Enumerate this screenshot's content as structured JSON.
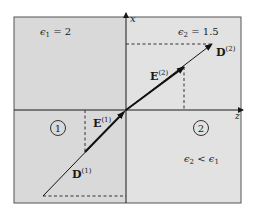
{
  "diagram": {
    "type": "dielectric-boundary-refraction",
    "colors": {
      "background": "#ffffff",
      "region_fill": "#dcdcdc",
      "frame": "#555555",
      "axis": "#1a1a1a",
      "vector": "#111111",
      "dashed": "#333333"
    },
    "axes": {
      "vertical_label": "x",
      "horizontal_label": "z"
    },
    "regions": [
      {
        "id": "1",
        "marker": "1",
        "permittivity_label": "ϵ₁ = 2"
      },
      {
        "id": "2",
        "marker": "2",
        "permittivity_label": "ϵ₂ = 1.5",
        "relation_label": "ϵ₂ < ϵ₁"
      }
    ],
    "vectors": [
      {
        "name": "D(1)",
        "symbol": "D",
        "superscript": "(1)",
        "region": "1"
      },
      {
        "name": "E(1)",
        "symbol": "E",
        "superscript": "(1)",
        "region": "1"
      },
      {
        "name": "E(2)",
        "symbol": "E",
        "superscript": "(2)",
        "region": "2"
      },
      {
        "name": "D(2)",
        "symbol": "D",
        "superscript": "(2)",
        "region": "2"
      }
    ]
  },
  "labels": {
    "eps1_symbol": "ϵ",
    "eps1_sub": "1",
    "eps1_value": " = 2",
    "eps2_symbol": "ϵ",
    "eps2_sub": "2",
    "eps2_value": " = 1.5",
    "relation_lhs": "ϵ",
    "relation_lhs_sub": "2",
    "relation_op": " < ",
    "relation_rhs": "ϵ",
    "relation_rhs_sub": "1",
    "region1_marker": "1",
    "region2_marker": "2",
    "axis_x": "x",
    "axis_z": "z",
    "D1_symbol": "D",
    "D1_sup": "(1)",
    "E1_symbol": "E",
    "E1_sup": "(1)",
    "E2_symbol": "E",
    "E2_sup": "(2)",
    "D2_symbol": "D",
    "D2_sup": "(2)"
  }
}
